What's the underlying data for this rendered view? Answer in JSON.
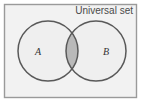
{
  "figure": {
    "type": "venn-diagram",
    "universal_set_label": "Universal set",
    "sets": [
      {
        "id": "A",
        "label": "A",
        "cx": 48,
        "cy": 51,
        "r": 30
      },
      {
        "id": "B",
        "label": "B",
        "cx": 96,
        "cy": 51,
        "r": 30
      }
    ],
    "shaded_region": "A ∩ B",
    "frame": {
      "x": 4.5,
      "y": 4.5,
      "width": 132,
      "height": 93
    }
  },
  "colors": {
    "page_background": "#ffffff",
    "universe_fill": "#f2f2f2",
    "universe_border": "#9a9a9a",
    "circle_fill": "#efefef",
    "circle_stroke": "#595959",
    "intersection_fill": "#b9b9b9",
    "label_text": "#333333",
    "universal_text": "#4a4a4a"
  },
  "chart_data": {
    "type": "diagram",
    "subtype": "venn",
    "title": "Universal set",
    "regions": [
      {
        "name": "A only",
        "shaded": false
      },
      {
        "name": "A ∩ B",
        "shaded": true
      },
      {
        "name": "B only",
        "shaded": false
      },
      {
        "name": "Universal set outside A ∪ B",
        "shaded": false
      }
    ],
    "set_labels": [
      "A",
      "B"
    ],
    "annotations": [
      "Universal set"
    ]
  }
}
